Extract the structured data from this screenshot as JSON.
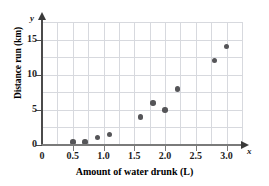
{
  "chart_data": {
    "type": "scatter",
    "title": "",
    "xlabel": "Amount of water drunk (L)",
    "ylabel": "Distance run (km)",
    "x_axis_variable": "x",
    "y_axis_variable": "y",
    "xlim": [
      0,
      3.25
    ],
    "ylim": [
      0,
      17.5
    ],
    "grid": true,
    "legend": "none",
    "x_ticks": [
      "0",
      "0.5",
      "1.0",
      "1.5",
      "2.0",
      "2.5",
      "3.0"
    ],
    "x_tick_values": [
      0,
      0.5,
      1.0,
      1.5,
      2.0,
      2.5,
      3.0
    ],
    "y_ticks": [
      "0",
      "5",
      "10",
      "15"
    ],
    "y_tick_values": [
      0,
      5,
      10,
      15
    ],
    "x_gridline_values": [
      0.25,
      0.5,
      0.75,
      1.0,
      1.25,
      1.5,
      1.75,
      2.0,
      2.25,
      2.5,
      2.75,
      3.0,
      3.25
    ],
    "y_gridline_values": [
      2.5,
      5,
      7.5,
      10,
      12.5,
      15,
      17.5
    ],
    "point_color": "#555558",
    "grid_color": "#d7d9de",
    "axis_color": "#4b4b4b",
    "points": [
      {
        "x": 0.5,
        "y": 0.4
      },
      {
        "x": 0.7,
        "y": 0.4
      },
      {
        "x": 0.9,
        "y": 1.1
      },
      {
        "x": 1.1,
        "y": 1.5
      },
      {
        "x": 1.6,
        "y": 4.0
      },
      {
        "x": 1.8,
        "y": 6.0
      },
      {
        "x": 2.0,
        "y": 5.0
      },
      {
        "x": 2.2,
        "y": 8.0
      },
      {
        "x": 2.8,
        "y": 12.0
      },
      {
        "x": 3.0,
        "y": 14.0
      }
    ]
  }
}
